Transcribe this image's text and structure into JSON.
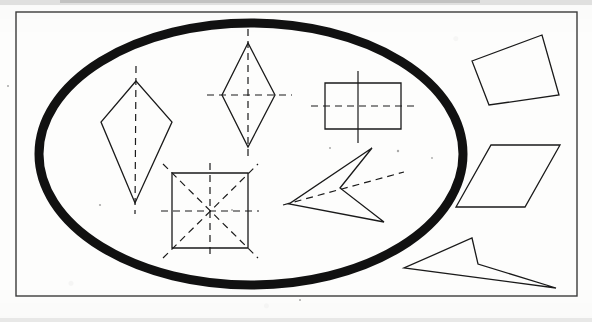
{
  "document": {
    "kind": "scanned-worksheet-figure",
    "title": "Shape sorting diagram: symmetrical shapes inside the oval",
    "background_color": "#fdfdfc",
    "ink_color": "#1a1a1a",
    "frame": {
      "label": "outer rectangular border",
      "x": 16,
      "y": 12,
      "width": 561,
      "height": 284,
      "stroke": "#3b3b3b",
      "stroke_width": 1.4
    },
    "scan_artifacts": {
      "top_edge_smudge": true,
      "bottom_edge_smudge": true,
      "speckles": [
        {
          "x": 100,
          "y": 205,
          "r": 1.1
        },
        {
          "x": 232,
          "y": 210,
          "r": 1.0
        },
        {
          "x": 398,
          "y": 151,
          "r": 1.2
        },
        {
          "x": 432,
          "y": 158,
          "r": 0.9
        },
        {
          "x": 8,
          "y": 86,
          "r": 1.0
        },
        {
          "x": 330,
          "y": 148,
          "r": 1.0
        },
        {
          "x": 300,
          "y": 300,
          "r": 1.0
        }
      ]
    }
  },
  "oval": {
    "name": "sorting-oval",
    "description": "thick black ellipse enclosing the symmetrical shapes",
    "cx": 251,
    "cy": 154,
    "rx": 212,
    "ry": 131,
    "stroke": "#111111",
    "stroke_width": 9
  },
  "legend": {
    "inside_meaning": "shapes that have at least one line of symmetry (axes drawn dashed)",
    "outside_meaning": "shapes with no line of symmetry"
  },
  "shapes": [
    {
      "id": "kite",
      "name": "kite",
      "position": "inside-oval",
      "lines_of_symmetry": 1,
      "outline": "136,81 101,122 135,203 172,122",
      "axes": [
        {
          "type": "vertical",
          "style": "dashed",
          "from": [
            136,
            66
          ],
          "to": [
            135,
            214
          ]
        }
      ]
    },
    {
      "id": "rhombus",
      "name": "rhombus",
      "position": "inside-oval",
      "lines_of_symmetry": 2,
      "outline": "248,43 222,95 248,147 275,95",
      "axes": [
        {
          "type": "vertical",
          "style": "dashed",
          "from": [
            248,
            29
          ],
          "to": [
            248,
            161
          ]
        },
        {
          "type": "horizontal",
          "style": "dashed",
          "from": [
            207,
            95
          ],
          "to": [
            292,
            95
          ]
        }
      ]
    },
    {
      "id": "rectangle",
      "name": "rectangle",
      "position": "inside-oval",
      "lines_of_symmetry": 2,
      "outline": "325,83 401,83 401,129 325,129",
      "axes": [
        {
          "type": "vertical",
          "style": "solid",
          "from": [
            358,
            71
          ],
          "to": [
            358,
            143
          ]
        },
        {
          "type": "horizontal",
          "style": "dashed",
          "from": [
            311,
            106
          ],
          "to": [
            415,
            106
          ]
        }
      ]
    },
    {
      "id": "square",
      "name": "square",
      "position": "inside-oval",
      "lines_of_symmetry": 4,
      "outline": "172,173 248,173 248,248 172,248",
      "axes": [
        {
          "type": "vertical",
          "style": "dashed",
          "from": [
            210,
            163
          ],
          "to": [
            210,
            259
          ]
        },
        {
          "type": "horizontal",
          "style": "dashed",
          "from": [
            161,
            211
          ],
          "to": [
            259,
            211
          ]
        },
        {
          "type": "diagonal-down",
          "style": "dashed",
          "from": [
            163,
            164
          ],
          "to": [
            258,
            258
          ]
        },
        {
          "type": "diagonal-up",
          "style": "dashed",
          "from": [
            163,
            258
          ],
          "to": [
            258,
            164
          ]
        }
      ]
    },
    {
      "id": "dart-inside",
      "name": "dart (concave arrowhead)",
      "position": "inside-oval",
      "lines_of_symmetry": 1,
      "outline": "372,148 289,204 384,222 340,188",
      "axes": [
        {
          "type": "oblique",
          "style": "dashed",
          "from": [
            283,
            205
          ],
          "to": [
            404,
            172
          ]
        }
      ]
    },
    {
      "id": "irregular-quadrilateral",
      "name": "irregular quadrilateral",
      "position": "outside-oval",
      "lines_of_symmetry": 0,
      "outline": "472,61 542,35 559,95 489,105",
      "axes": []
    },
    {
      "id": "parallelogram",
      "name": "parallelogram",
      "position": "outside-oval",
      "lines_of_symmetry": 0,
      "outline": "491,145 560,145 525,207 456,207",
      "axes": []
    },
    {
      "id": "dart-outside",
      "name": "dart (concave arrowhead)",
      "position": "outside-oval",
      "lines_of_symmetry": 0,
      "outline": "472,238 478,264 556,288 404,268",
      "axes": []
    }
  ]
}
